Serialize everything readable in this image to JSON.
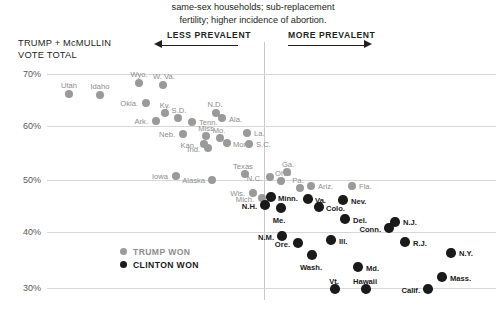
{
  "caption": {
    "line1": "same-sex households; sub-replacement",
    "line2": "fertility; higher incidence of abortion."
  },
  "axis": {
    "y_title_line1": "TRUMP + McMULLIN",
    "y_title_line2": "VOTE TOTAL",
    "y_ticks": [
      "70%",
      "60%",
      "50%",
      "40%",
      "30%"
    ]
  },
  "direction": {
    "less": "LESS PREVALENT",
    "more": "MORE PREVALENT"
  },
  "legend": {
    "trump": "TRUMP WON",
    "clinton": "CLINTON WON"
  },
  "colors": {
    "trump": "#9a9a9a",
    "clinton": "#1a1a1a",
    "grid": "#d7d7d7",
    "text": "#231f20"
  },
  "chart_data": {
    "type": "scatter",
    "title": "",
    "xlabel": "",
    "ylabel": "TRUMP + McMULLIN VOTE TOTAL",
    "ylim": [
      28,
      72
    ],
    "grid": true,
    "legend_position": "inside-lower-left",
    "y_tick_values": [
      70,
      60,
      50,
      40,
      30
    ],
    "series": [
      {
        "name": "TRUMP WON",
        "color": "#9a9a9a",
        "points": [
          {
            "label": "Utah",
            "px": 69,
            "py": 94,
            "y": 66.1
          },
          {
            "label": "Idaho",
            "px": 100,
            "py": 95,
            "y": 65.9
          },
          {
            "label": "Wyo.",
            "px": 139,
            "py": 83,
            "y": 68.2
          },
          {
            "label": "W. Va.",
            "px": 163,
            "py": 85,
            "y": 67.8
          },
          {
            "label": "Okla.",
            "px": 146,
            "py": 103,
            "y": 64.4
          },
          {
            "label": "Ky.",
            "px": 165,
            "py": 113,
            "y": 62.5
          },
          {
            "label": "S.D.",
            "px": 178,
            "py": 118,
            "y": 61.5
          },
          {
            "label": "Ark.",
            "px": 156,
            "py": 121,
            "y": 61.0
          },
          {
            "label": "N.D.",
            "px": 216,
            "py": 113,
            "y": 62.5
          },
          {
            "label": "Ala.",
            "px": 222,
            "py": 118,
            "y": 61.5
          },
          {
            "label": "Tenn.",
            "px": 192,
            "py": 122,
            "y": 60.9
          },
          {
            "label": "Neb.",
            "px": 183,
            "py": 134,
            "y": 58.6
          },
          {
            "label": "Miss.",
            "px": 206,
            "py": 136,
            "y": 58.2
          },
          {
            "label": "Kan.",
            "px": 204,
            "py": 144,
            "y": 56.7
          },
          {
            "label": "Ind.",
            "px": 208,
            "py": 148,
            "y": 55.9
          },
          {
            "label": "Mo.",
            "px": 220,
            "py": 138,
            "y": 57.8
          },
          {
            "label": "Mont.",
            "px": 227,
            "py": 143,
            "y": 56.9
          },
          {
            "label": "La.",
            "px": 247,
            "py": 133,
            "y": 58.8
          },
          {
            "label": "S.C.",
            "px": 249,
            "py": 144,
            "y": 56.7
          },
          {
            "label": "Iowa",
            "px": 176,
            "py": 176,
            "y": 50.5
          },
          {
            "label": "Alaska",
            "px": 212,
            "py": 180,
            "y": 49.8
          },
          {
            "label": "Texas",
            "px": 245,
            "py": 174,
            "y": 50.9
          },
          {
            "label": "Ohio",
            "px": 281,
            "py": 181,
            "y": 49.6
          },
          {
            "label": "N.C.",
            "px": 270,
            "py": 177,
            "y": 50.3
          },
          {
            "label": "Ga.",
            "px": 287,
            "py": 172,
            "y": 51.3
          },
          {
            "label": "Pa.",
            "px": 300,
            "py": 188,
            "y": 48.2
          },
          {
            "label": "Ariz.",
            "px": 311,
            "py": 186,
            "y": 48.5
          },
          {
            "label": "Fla.",
            "px": 352,
            "py": 186,
            "y": 48.5
          },
          {
            "label": "Wis.",
            "px": 253,
            "py": 193,
            "y": 47.3
          },
          {
            "label": "Mich.",
            "px": 262,
            "py": 198,
            "y": 46.3
          }
        ]
      },
      {
        "name": "CLINTON WON",
        "color": "#1a1a1a",
        "points": [
          {
            "label": "Minn.",
            "px": 271,
            "py": 197,
            "y": 46.5
          },
          {
            "label": "N.H.",
            "px": 265,
            "py": 205,
            "y": 45.0
          },
          {
            "label": "Me.",
            "px": 281,
            "py": 208,
            "y": 44.5
          },
          {
            "label": "Va.",
            "px": 308,
            "py": 199,
            "y": 46.1
          },
          {
            "label": "Colo.",
            "px": 319,
            "py": 207,
            "y": 44.6
          },
          {
            "label": "Nev.",
            "px": 343,
            "py": 200,
            "y": 46.0
          },
          {
            "label": "Del.",
            "px": 345,
            "py": 219,
            "y": 42.4
          },
          {
            "label": "N.J.",
            "px": 395,
            "py": 222,
            "y": 41.8
          },
          {
            "label": "N.M.",
            "px": 282,
            "py": 236,
            "y": 39.2
          },
          {
            "label": "Conn.",
            "px": 389,
            "py": 228,
            "y": 40.7
          },
          {
            "label": "R.J.",
            "px": 405,
            "py": 242,
            "y": 38.0
          },
          {
            "label": "Ore.",
            "px": 298,
            "py": 243,
            "y": 37.9
          },
          {
            "label": "Ill.",
            "px": 331,
            "py": 240,
            "y": 38.4
          },
          {
            "label": "Wash.",
            "px": 312,
            "py": 255,
            "y": 35.7
          },
          {
            "label": "N.Y.",
            "px": 451,
            "py": 253,
            "y": 36.0
          },
          {
            "label": "Md.",
            "px": 358,
            "py": 267,
            "y": 33.5
          },
          {
            "label": "Vt.",
            "px": 335,
            "py": 289,
            "y": 29.9
          },
          {
            "label": "Hawaii",
            "px": 366,
            "py": 289,
            "y": 29.9
          },
          {
            "label": "Calif.",
            "px": 428,
            "py": 289,
            "y": 30.0
          },
          {
            "label": "Mass.",
            "px": 442,
            "py": 277,
            "y": 32.0
          }
        ]
      }
    ]
  }
}
